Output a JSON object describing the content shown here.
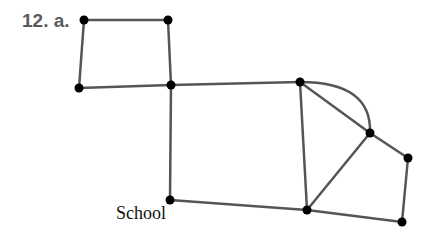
{
  "problem": {
    "number_label": "12. a."
  },
  "labels": {
    "school": "School"
  },
  "colors": {
    "edge": "#555555",
    "node": "#000000"
  },
  "graph": {
    "nodes": [
      {
        "id": "A",
        "x": 84,
        "y": 20
      },
      {
        "id": "B",
        "x": 168,
        "y": 20
      },
      {
        "id": "C",
        "x": 79,
        "y": 88
      },
      {
        "id": "D",
        "x": 171,
        "y": 85
      },
      {
        "id": "E",
        "x": 300,
        "y": 82
      },
      {
        "id": "F",
        "x": 370,
        "y": 133
      },
      {
        "id": "G",
        "x": 408,
        "y": 158
      },
      {
        "id": "H",
        "x": 402,
        "y": 222
      },
      {
        "id": "I",
        "x": 307,
        "y": 210
      },
      {
        "id": "School",
        "x": 170,
        "y": 200
      }
    ],
    "edges": [
      [
        "A",
        "B"
      ],
      [
        "A",
        "C"
      ],
      [
        "B",
        "D"
      ],
      [
        "C",
        "D"
      ],
      [
        "D",
        "E"
      ],
      [
        "D",
        "School"
      ],
      [
        "E",
        "I"
      ],
      [
        "E",
        "F"
      ],
      [
        "F",
        "G"
      ],
      [
        "G",
        "H"
      ],
      [
        "H",
        "I"
      ],
      [
        "I",
        "F"
      ],
      [
        "School",
        "I"
      ]
    ],
    "curved_edges": [
      [
        "E",
        "F"
      ]
    ]
  }
}
